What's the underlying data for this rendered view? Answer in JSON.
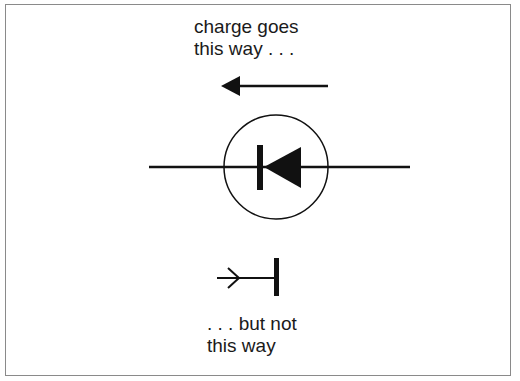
{
  "diagram": {
    "type": "diode-symbol-illustration",
    "top_caption": {
      "line1": "charge goes",
      "line2": "this way . . ."
    },
    "bottom_caption": {
      "line1": ". . . but not",
      "line2": "this way"
    },
    "elements": [
      {
        "name": "allowed-direction-arrow",
        "direction": "left",
        "style": "filled-head"
      },
      {
        "name": "diode-symbol",
        "enclosed_in_circle": true,
        "triangle_points": "left",
        "cathode_bar": "left"
      },
      {
        "name": "blocked-direction-arrow",
        "direction": "right",
        "style": "open-head",
        "terminated_by": "bar"
      }
    ],
    "colors": {
      "stroke": "#111111",
      "frame": "#8a8a8a",
      "background": "#ffffff"
    }
  }
}
